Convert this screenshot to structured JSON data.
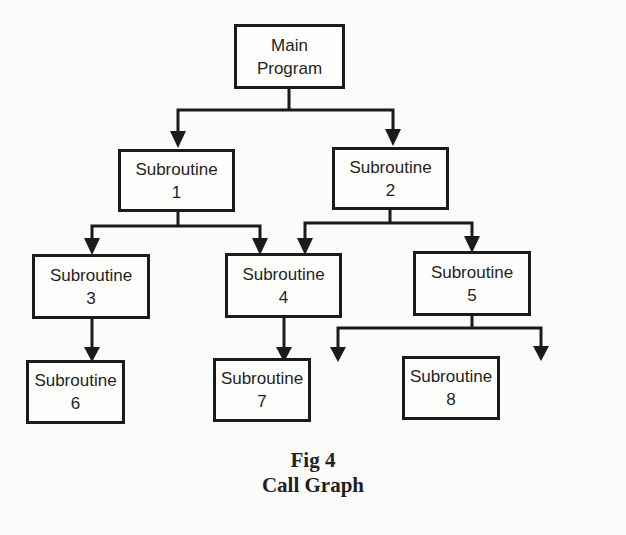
{
  "diagram": {
    "type": "call-graph",
    "nodes": {
      "main": {
        "line1": "Main",
        "line2": "Program"
      },
      "sub1": {
        "line1": "Subroutine",
        "line2": "1"
      },
      "sub2": {
        "line1": "Subroutine",
        "line2": "2"
      },
      "sub3": {
        "line1": "Subroutine",
        "line2": "3"
      },
      "sub4": {
        "line1": "Subroutine",
        "line2": "4"
      },
      "sub5": {
        "line1": "Subroutine",
        "line2": "5"
      },
      "sub6": {
        "line1": "Subroutine",
        "line2": "6"
      },
      "sub7": {
        "line1": "Subroutine",
        "line2": "7"
      },
      "sub8": {
        "line1": "Subroutine",
        "line2": "8"
      }
    },
    "edges": [
      {
        "from": "Main Program",
        "to": "Subroutine 1"
      },
      {
        "from": "Main Program",
        "to": "Subroutine 2"
      },
      {
        "from": "Subroutine 1",
        "to": "Subroutine 3"
      },
      {
        "from": "Subroutine 1",
        "to": "Subroutine 4"
      },
      {
        "from": "Subroutine 2",
        "to": "Subroutine 4"
      },
      {
        "from": "Subroutine 2",
        "to": "Subroutine 5"
      },
      {
        "from": "Subroutine 3",
        "to": "Subroutine 6"
      },
      {
        "from": "Subroutine 4",
        "to": "Subroutine 7"
      },
      {
        "from": "Subroutine 5",
        "to": "Subroutine 7"
      },
      {
        "from": "Subroutine 5",
        "to": "Subroutine 8"
      }
    ]
  },
  "caption": {
    "figure": "Fig 4",
    "title": "Call Graph"
  }
}
